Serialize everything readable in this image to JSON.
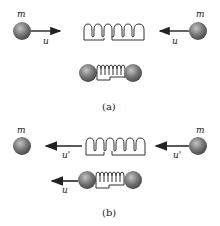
{
  "diagram": {
    "panel_a": {
      "caption": "(a)",
      "left_mass_label": "m",
      "right_mass_label": "m",
      "left_velocity_label": "u",
      "right_velocity_label": "u"
    },
    "panel_b": {
      "caption": "(b)",
      "left_mass_label": "m",
      "right_mass_label": "m",
      "left_velocity_label": "u'",
      "right_velocity_label": "u'",
      "combined_velocity_label": "u"
    },
    "colors": {
      "ball": "#6b6b6b",
      "ball_highlight": "#b0b0b0",
      "line": "#222222",
      "background": "#ffffff"
    }
  }
}
